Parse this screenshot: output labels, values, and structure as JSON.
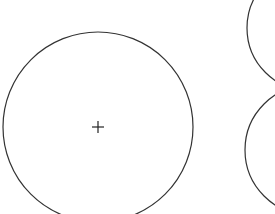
{
  "diagram": {
    "background": "#ffffff",
    "stroke_color": "#333333",
    "circles": [
      {
        "name": "main-circle",
        "cx": 98,
        "cy": 127,
        "r": 95,
        "has_center_mark": true
      },
      {
        "name": "top-right-circle",
        "cx": 310,
        "cy": 28,
        "r": 63,
        "has_center_mark": false
      },
      {
        "name": "bottom-right-circle",
        "cx": 310,
        "cy": 150,
        "r": 65,
        "has_center_mark": false
      }
    ],
    "center_mark": {
      "x": 98,
      "y": 127,
      "arm": 6
    }
  }
}
